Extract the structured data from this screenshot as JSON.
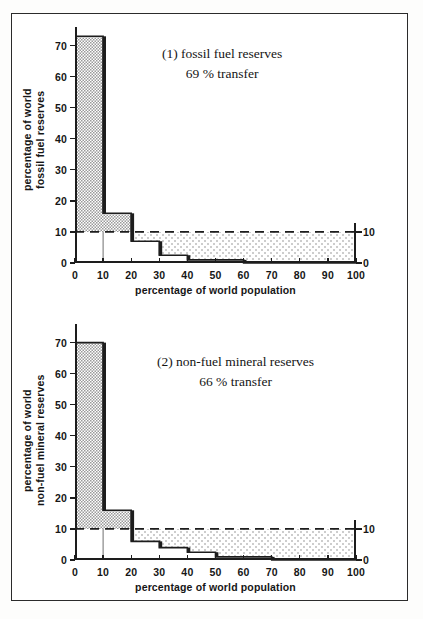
{
  "figure": {
    "background": "#ffffff",
    "border_color": "#2b2b2b",
    "ink_color": "#1d1d1d",
    "hatch_color": "#9a9a9a",
    "dot_color": "#8d8d8d"
  },
  "chart_data": [
    {
      "type": "bar",
      "id": "fossil-fuel",
      "title": "(1) fossil fuel reserves",
      "subtitle": "69 % transfer",
      "xlabel": "percentage of world population",
      "ylabel": "percentage of world\nfossil fuel reserves",
      "ylabel_line1": "percentage of world",
      "ylabel_line2": "fossil fuel reserves",
      "xlim": [
        0,
        100
      ],
      "ylim": [
        0,
        76
      ],
      "xticks": [
        0,
        10,
        20,
        30,
        40,
        50,
        60,
        70,
        80,
        90,
        100
      ],
      "xticklabels": [
        "0",
        "10",
        "20",
        "30",
        "40",
        "50",
        "60",
        "70",
        "80",
        "90",
        "100"
      ],
      "yticks": [
        0,
        10,
        20,
        30,
        40,
        50,
        60,
        70
      ],
      "yticklabels": [
        "0",
        "10",
        "20",
        "30",
        "40",
        "50",
        "60",
        "70"
      ],
      "right_axis_at_x": 100,
      "right_yticks": [
        0,
        10
      ],
      "right_yticklabels": [
        "0",
        "10"
      ],
      "reference_line": {
        "value": 10,
        "style": "dashed",
        "label": "10 % equal-share level"
      },
      "bin_edges": [
        0,
        10,
        20,
        30,
        40,
        50,
        60,
        100
      ],
      "values": [
        73,
        16,
        7,
        2.5,
        1,
        1,
        0
      ],
      "grid": false,
      "legend": "none",
      "notes": "Step histogram of cumulative world population deciles against share of world fossil fuel reserves; hatched area above the 10 % line is surplus, dotted area below is deficit."
    },
    {
      "type": "bar",
      "id": "non-fuel-mineral",
      "title": "(2) non-fuel mineral reserves",
      "subtitle": "66 % transfer",
      "xlabel": "percentage of world population",
      "ylabel": "percentage of world\nnon-fuel mineral reserves",
      "ylabel_line1": "percentage of world",
      "ylabel_line2": "non-fuel mineral reserves",
      "xlim": [
        0,
        100
      ],
      "ylim": [
        0,
        76
      ],
      "xticks": [
        0,
        10,
        20,
        30,
        40,
        50,
        60,
        70,
        80,
        90,
        100
      ],
      "xticklabels": [
        "0",
        "10",
        "20",
        "30",
        "40",
        "50",
        "60",
        "70",
        "80",
        "90",
        "100"
      ],
      "yticks": [
        0,
        10,
        20,
        30,
        40,
        50,
        60,
        70
      ],
      "yticklabels": [
        "0",
        "10",
        "20",
        "30",
        "40",
        "50",
        "60",
        "70"
      ],
      "right_axis_at_x": 100,
      "right_yticks": [
        0,
        10
      ],
      "right_yticklabels": [
        "0",
        "10"
      ],
      "reference_line": {
        "value": 10,
        "style": "dashed",
        "label": "10 % equal-share level"
      },
      "bin_edges": [
        0,
        10,
        20,
        30,
        40,
        50,
        60,
        70,
        100
      ],
      "values": [
        70,
        16,
        6,
        4,
        2.5,
        1,
        1,
        0
      ],
      "grid": false,
      "legend": "none",
      "notes": "Step histogram of cumulative world population deciles against share of world non-fuel mineral reserves."
    }
  ]
}
